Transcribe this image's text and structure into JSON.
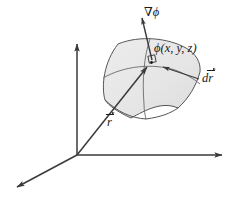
{
  "figure": {
    "background_color": "#ffffff",
    "line_color": "#3a3a3a",
    "surface_fill_color": "#e8e8e8",
    "surface_edge_color": "#555555",
    "label_color": "#1a1a1a",
    "width": 238,
    "height": 203
  },
  "labels": {
    "gradient": "∇ϕ",
    "scalar_field": "ϕ(x, y, z)",
    "displacement_d": "d",
    "displacement_r": "r",
    "position_r": "r"
  },
  "axes": {
    "origin": {
      "x": 77,
      "y": 155
    },
    "vertical": {
      "label": "",
      "tip_x": 77,
      "tip_y": 38
    },
    "horizontal": {
      "label": "",
      "tip_x": 228,
      "tip_y": 155
    },
    "diagonal": {
      "label": "",
      "tip_x": 11,
      "tip_y": 190
    }
  },
  "vectors": {
    "position": {
      "name": "r",
      "from_x": 77,
      "from_y": 155,
      "to_x": 151,
      "to_y": 62
    },
    "gradient": {
      "name": "grad-phi",
      "from_x": 152,
      "from_y": 60,
      "to_x": 141,
      "to_y": 13
    },
    "displacement": {
      "name": "dr",
      "from_x": 160,
      "from_y": 66,
      "to_x": 199,
      "to_y": 79
    }
  },
  "point": {
    "x": 152,
    "y": 61,
    "right_angle_marker": true
  },
  "icons": {
    "arrowhead": "arrowhead-icon",
    "right-angle": "right-angle-marker-icon"
  }
}
